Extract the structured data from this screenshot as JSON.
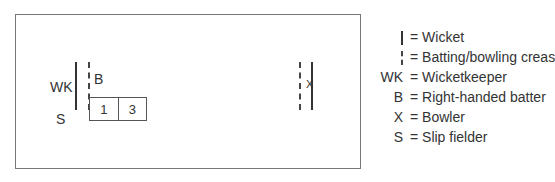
{
  "diagram": {
    "field_labels": {
      "wicketkeeper": "WK",
      "batter": "B",
      "slip": "S"
    },
    "bowler_marker": "X",
    "score_box": [
      "1",
      "3"
    ]
  },
  "legend": [
    {
      "symbol": "wicket",
      "symbol_text": "",
      "label": "= Wicket"
    },
    {
      "symbol": "crease",
      "symbol_text": "",
      "label": "= Batting/bowling crease"
    },
    {
      "symbol": "text",
      "symbol_text": "WK",
      "label": "= Wicketkeeper"
    },
    {
      "symbol": "text",
      "symbol_text": "B",
      "label": "= Right-handed batter"
    },
    {
      "symbol": "text",
      "symbol_text": "X",
      "label": "= Bowler"
    },
    {
      "symbol": "text",
      "symbol_text": "S",
      "label": "= Slip fielder"
    }
  ]
}
